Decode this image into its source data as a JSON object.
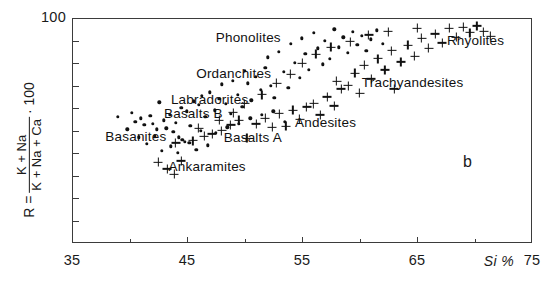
{
  "figure": {
    "panel_letter": "b",
    "x_unit_label": "Si %"
  },
  "chart_data": {
    "type": "scatter",
    "title": "",
    "xlabel": "Si %",
    "ylabel": "R = (K + Na) / (K + Na + Ca) · 100",
    "ylabel_parts": {
      "prefix": "R =",
      "numerator": "K + Na",
      "denominator": "K + Na + Ca",
      "multiplier": "· 100"
    },
    "xlim": [
      35,
      75
    ],
    "ylim": [
      0,
      100
    ],
    "grid": false,
    "legend": "none",
    "x_ticks_major": [
      35,
      45,
      55,
      65,
      75
    ],
    "x_tick_labels": [
      "35",
      "45",
      "55",
      "65",
      "75"
    ],
    "x_ticks_minor": [
      40,
      50,
      60,
      70
    ],
    "y_ticks_major": [
      100
    ],
    "y_tick_labels": [
      "100"
    ],
    "y_ticks_minor": [
      10,
      20,
      30,
      40,
      50,
      60,
      70,
      80,
      90
    ],
    "series": [
      {
        "name": "dot-series",
        "marker": "dot",
        "points": [
          [
            39.0,
            56.0
          ],
          [
            40.2,
            58.0
          ],
          [
            40.5,
            54.0
          ],
          [
            41.0,
            55.5
          ],
          [
            41.3,
            52.5
          ],
          [
            41.8,
            56.5
          ],
          [
            42.0,
            53.0
          ],
          [
            42.4,
            50.5
          ],
          [
            42.6,
            62.5
          ],
          [
            42.2,
            47.5
          ],
          [
            43.0,
            54.5
          ],
          [
            43.2,
            51.0
          ],
          [
            43.5,
            57.0
          ],
          [
            43.8,
            49.5
          ],
          [
            44.0,
            53.5
          ],
          [
            44.3,
            47.0
          ],
          [
            44.6,
            46.0
          ],
          [
            44.8,
            45.0
          ],
          [
            44.5,
            60.0
          ],
          [
            45.0,
            58.5
          ],
          [
            45.3,
            52.0
          ],
          [
            45.6,
            63.0
          ],
          [
            45.2,
            44.5
          ],
          [
            46.0,
            61.5
          ],
          [
            46.3,
            65.5
          ],
          [
            46.6,
            56.0
          ],
          [
            46.2,
            50.0
          ],
          [
            47.0,
            67.0
          ],
          [
            47.4,
            59.0
          ],
          [
            47.8,
            64.0
          ],
          [
            48.0,
            70.5
          ],
          [
            48.4,
            62.0
          ],
          [
            48.8,
            57.5
          ],
          [
            49.0,
            72.0
          ],
          [
            49.4,
            66.0
          ],
          [
            49.8,
            60.5
          ],
          [
            50.0,
            76.5
          ],
          [
            50.3,
            71.0
          ],
          [
            50.6,
            63.5
          ],
          [
            51.0,
            74.0
          ],
          [
            51.4,
            68.0
          ],
          [
            51.8,
            78.0
          ],
          [
            52.0,
            82.5
          ],
          [
            52.3,
            70.0
          ],
          [
            52.6,
            64.5
          ],
          [
            53.0,
            85.0
          ],
          [
            53.4,
            76.0
          ],
          [
            53.8,
            69.0
          ],
          [
            54.0,
            88.5
          ],
          [
            54.4,
            80.0
          ],
          [
            54.8,
            73.5
          ],
          [
            55.0,
            91.0
          ],
          [
            55.3,
            84.0
          ],
          [
            55.6,
            77.0
          ],
          [
            56.0,
            93.5
          ],
          [
            56.4,
            86.5
          ],
          [
            56.8,
            79.5
          ],
          [
            57.0,
            90.0
          ],
          [
            57.4,
            82.0
          ],
          [
            57.8,
            95.0
          ],
          [
            58.2,
            87.0
          ],
          [
            58.6,
            91.5
          ],
          [
            59.0,
            84.5
          ],
          [
            59.4,
            94.0
          ],
          [
            59.8,
            88.0
          ],
          [
            60.2,
            92.0
          ],
          [
            60.6,
            85.5
          ],
          [
            61.0,
            90.5
          ],
          [
            61.5,
            94.5
          ],
          [
            62.0,
            88.5
          ],
          [
            50.5,
            55.5
          ],
          [
            51.5,
            57.0
          ],
          [
            52.5,
            58.5
          ],
          [
            53.5,
            54.0
          ],
          [
            49.5,
            53.0
          ],
          [
            48.5,
            51.5
          ],
          [
            47.5,
            49.0
          ],
          [
            46.8,
            43.5
          ],
          [
            45.8,
            41.5
          ],
          [
            44.2,
            40.0
          ],
          [
            43.6,
            43.0
          ],
          [
            42.8,
            41.0
          ],
          [
            41.5,
            44.0
          ],
          [
            40.8,
            47.0
          ],
          [
            39.8,
            50.5
          ]
        ]
      },
      {
        "name": "cross-series",
        "marker": "plus",
        "points": [
          [
            42.5,
            36.0
          ],
          [
            43.3,
            33.0
          ],
          [
            43.9,
            30.5
          ],
          [
            44.5,
            36.5
          ],
          [
            44.0,
            44.5
          ],
          [
            45.5,
            45.5
          ],
          [
            46.5,
            47.5
          ],
          [
            47.2,
            48.5
          ],
          [
            48.0,
            50.0
          ],
          [
            48.8,
            52.5
          ],
          [
            49.5,
            54.5
          ],
          [
            50.2,
            46.5
          ],
          [
            51.0,
            53.0
          ],
          [
            51.8,
            55.5
          ],
          [
            52.4,
            51.5
          ],
          [
            53.0,
            57.5
          ],
          [
            53.6,
            52.0
          ],
          [
            54.2,
            59.0
          ],
          [
            54.8,
            55.0
          ],
          [
            55.4,
            60.5
          ],
          [
            56.0,
            62.0
          ],
          [
            56.6,
            57.0
          ],
          [
            57.2,
            65.0
          ],
          [
            57.8,
            61.0
          ],
          [
            58.4,
            68.5
          ],
          [
            58.0,
            72.0
          ],
          [
            59.0,
            70.0
          ],
          [
            59.6,
            75.5
          ],
          [
            60.0,
            66.5
          ],
          [
            60.4,
            79.0
          ],
          [
            61.0,
            73.0
          ],
          [
            61.6,
            82.0
          ],
          [
            62.2,
            77.0
          ],
          [
            62.8,
            85.5
          ],
          [
            63.0,
            68.5
          ],
          [
            63.6,
            80.5
          ],
          [
            64.2,
            88.0
          ],
          [
            64.8,
            83.0
          ],
          [
            65.4,
            91.0
          ],
          [
            66.0,
            86.5
          ],
          [
            66.6,
            93.0
          ],
          [
            67.2,
            89.0
          ],
          [
            67.8,
            95.5
          ],
          [
            68.4,
            91.5
          ],
          [
            69.0,
            96.0
          ],
          [
            69.6,
            93.5
          ],
          [
            70.2,
            96.5
          ],
          [
            70.8,
            94.0
          ],
          [
            71.4,
            92.0
          ],
          [
            65.0,
            95.5
          ],
          [
            62.5,
            94.0
          ],
          [
            60.8,
            92.5
          ],
          [
            59.2,
            89.5
          ],
          [
            57.5,
            87.0
          ],
          [
            56.2,
            84.0
          ],
          [
            55.0,
            80.0
          ],
          [
            54.0,
            75.0
          ],
          [
            52.8,
            71.0
          ],
          [
            51.5,
            66.0
          ],
          [
            50.0,
            62.0
          ],
          [
            49.0,
            58.0
          ],
          [
            47.8,
            54.5
          ],
          [
            46.0,
            51.0
          ]
        ]
      }
    ],
    "annotations": [
      {
        "text": "Phonolites",
        "x": 47.5,
        "y": 91.0
      },
      {
        "text": "Ordanchites",
        "x": 45.8,
        "y": 75.0
      },
      {
        "text": "Labradorites",
        "x": 43.6,
        "y": 63.5
      },
      {
        "text": "Basalts B",
        "x": 43.0,
        "y": 57.5
      },
      {
        "text": "Basanites",
        "x": 37.9,
        "y": 47.0
      },
      {
        "text": "Basalts A",
        "x": 48.2,
        "y": 46.5
      },
      {
        "text": "Ankaramites",
        "x": 43.4,
        "y": 34.0
      },
      {
        "text": "Andesites",
        "x": 54.4,
        "y": 53.5
      },
      {
        "text": "Trachyandesites",
        "x": 60.2,
        "y": 71.0
      },
      {
        "text": "Rhyolites",
        "x": 67.6,
        "y": 90.0
      }
    ]
  }
}
